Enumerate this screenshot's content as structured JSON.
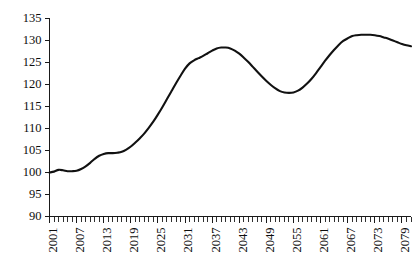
{
  "chart_data": {
    "type": "line",
    "title": "",
    "subtitle": "",
    "xlabel": "",
    "ylabel": "",
    "xlim": [
      2001,
      2081
    ],
    "ylim": [
      90,
      135
    ],
    "grid": false,
    "legend": null,
    "y_ticks": [
      90,
      95,
      100,
      105,
      110,
      115,
      120,
      125,
      130,
      135
    ],
    "y_tick_labels": [
      "90",
      "95",
      "100",
      "105",
      "110",
      "115",
      "120",
      "125",
      "130",
      "135"
    ],
    "x_tick_labels": [
      "2001",
      "2007",
      "2013",
      "2019",
      "2025",
      "2031",
      "2037",
      "2043",
      "2049",
      "2055",
      "2061",
      "2067",
      "2073",
      "2079"
    ],
    "x_tick_values": [
      2001,
      2007,
      2013,
      2019,
      2025,
      2031,
      2037,
      2043,
      2049,
      2055,
      2061,
      2067,
      2073,
      2079
    ],
    "x_minor_tick_step": 1,
    "line_color": "#111111",
    "axis_color": "#1a1a1a",
    "background_color": "#ffffff",
    "series": [
      {
        "name": "Index",
        "x": [
          2001,
          2002,
          2003,
          2004,
          2005,
          2006,
          2007,
          2008,
          2009,
          2010,
          2011,
          2012,
          2013,
          2014,
          2015,
          2016,
          2017,
          2018,
          2019,
          2020,
          2021,
          2022,
          2023,
          2024,
          2025,
          2026,
          2027,
          2028,
          2029,
          2030,
          2031,
          2032,
          2033,
          2034,
          2035,
          2036,
          2037,
          2038,
          2039,
          2040,
          2041,
          2042,
          2043,
          2044,
          2045,
          2046,
          2047,
          2048,
          2049,
          2050,
          2051,
          2052,
          2053,
          2054,
          2055,
          2056,
          2057,
          2058,
          2059,
          2060,
          2061,
          2062,
          2063,
          2064,
          2065,
          2066,
          2067,
          2068,
          2069,
          2070,
          2071,
          2072,
          2073,
          2074,
          2075,
          2076,
          2077,
          2078,
          2079,
          2080,
          2081
        ],
        "values": [
          100.0,
          100.2,
          100.6,
          100.5,
          100.3,
          100.3,
          100.4,
          100.8,
          101.4,
          102.2,
          103.1,
          103.8,
          104.2,
          104.4,
          104.4,
          104.5,
          104.7,
          105.2,
          105.9,
          106.8,
          107.8,
          108.9,
          110.2,
          111.6,
          113.2,
          114.9,
          116.7,
          118.5,
          120.3,
          122.0,
          123.6,
          124.8,
          125.5,
          126.0,
          126.5,
          127.1,
          127.7,
          128.2,
          128.4,
          128.4,
          128.2,
          127.7,
          127.0,
          126.1,
          125.1,
          124.0,
          122.9,
          121.8,
          120.8,
          119.9,
          119.1,
          118.5,
          118.2,
          118.1,
          118.2,
          118.6,
          119.3,
          120.2,
          121.3,
          122.6,
          124.0,
          125.4,
          126.7,
          127.9,
          129.0,
          129.9,
          130.5,
          131.0,
          131.2,
          131.3,
          131.3,
          131.3,
          131.2,
          131.0,
          130.7,
          130.4,
          130.0,
          129.6,
          129.2,
          128.9,
          128.7
        ]
      }
    ]
  }
}
